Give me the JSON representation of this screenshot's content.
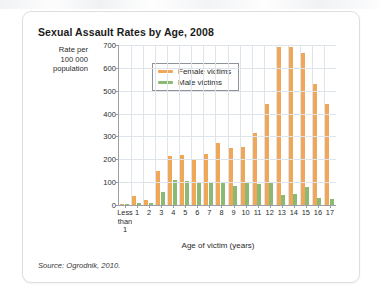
{
  "figure": {
    "title": "Sexual Assault Rates by Age, 2008",
    "y_axis_caption_lines": [
      "Rate per",
      "100 000",
      "population"
    ],
    "x_axis_title": "Age of victim (years)",
    "source": "Source: Ogrodnik, 2010."
  },
  "legend": {
    "position": "top-left-inside",
    "entries": [
      {
        "label": "Female victims",
        "color": "#f0a758"
      },
      {
        "label": "Male victims",
        "color": "#8cba72"
      }
    ]
  },
  "colors": {
    "female": "#f0a758",
    "male": "#8cba72",
    "axis": "#9aa0a6",
    "grid": "#dfe3ea",
    "card_border": "#dcdfe2"
  },
  "chart_data": {
    "type": "bar",
    "title": "Sexual Assault Rates by Age, 2008",
    "xlabel": "Age of victim (years)",
    "ylabel": "Rate per 100 000 population",
    "ylim": [
      0,
      700
    ],
    "yticks": [
      0,
      100,
      200,
      300,
      400,
      500,
      600,
      700
    ],
    "grid": true,
    "legend_position": "upper left",
    "categories": [
      "Less than 1",
      "1",
      "2",
      "3",
      "4",
      "5",
      "6",
      "7",
      "8",
      "9",
      "10",
      "11",
      "12",
      "13",
      "14",
      "15",
      "16",
      "17"
    ],
    "series": [
      {
        "name": "Female victims",
        "color": "#f0a758",
        "values": [
          5,
          40,
          20,
          150,
          215,
          220,
          195,
          225,
          270,
          250,
          255,
          315,
          440,
          690,
          690,
          665,
          530,
          440
        ]
      },
      {
        "name": "Male victims",
        "color": "#8cba72",
        "values": [
          3,
          10,
          8,
          55,
          110,
          105,
          100,
          95,
          100,
          85,
          100,
          90,
          100,
          45,
          50,
          80,
          30,
          25
        ]
      }
    ]
  }
}
